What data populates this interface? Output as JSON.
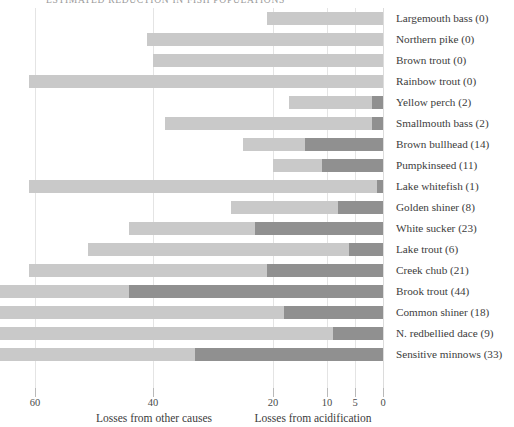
{
  "chart_data": {
    "type": "bar",
    "title": "ESTIMATED REDUCTION IN FISH POPULATIONS",
    "orientation": "horizontal-stacked",
    "stacking": "bidirectional-from-right",
    "grid": true,
    "legend_position": "none",
    "xlabel_left": "Losses from other causes",
    "xlabel_right": "Losses from acidification",
    "ylabel": "",
    "axis_direction": "reversed (values decrease left to right, zero at right)",
    "axis_note": "Broken / expanded scale: 60-20 compressed, 20-0 expanded",
    "tick_values": [
      60,
      40,
      20,
      10,
      5,
      0
    ],
    "tick_labels": [
      "60",
      "40",
      "20",
      "10",
      "5",
      "0"
    ],
    "xlim": [
      66,
      0
    ],
    "categories": [
      "Largemouth bass (0)",
      "Northern pike (0)",
      "Brown trout (0)",
      "Rainbow trout (0)",
      "Yellow perch (2)",
      "Smallmouth bass (2)",
      "Brown bullhead (14)",
      "Pumpkinseed (11)",
      "Lake whitefish (1)",
      "Golden shiner (8)",
      "White sucker (23)",
      "Lake trout (6)",
      "Creek chub (21)",
      "Brook trout (44)",
      "Common shiner (18)",
      "N. redbellied dace (9)",
      "Sensitive minnows (33)"
    ],
    "series": [
      {
        "name": "Losses from other causes",
        "color": "#c9c9c9",
        "values": [
          21,
          41,
          40,
          61,
          15,
          36,
          11,
          9,
          60,
          19,
          21,
          45,
          40,
          24,
          53,
          66,
          41
        ]
      },
      {
        "name": "Losses from acidification",
        "color": "#909090",
        "values": [
          0,
          0,
          0,
          0,
          2,
          2,
          14,
          11,
          1,
          8,
          23,
          6,
          21,
          44,
          18,
          9,
          33
        ]
      }
    ]
  },
  "colors": {
    "other_causes": "#c9c9c9",
    "acidification": "#909090",
    "gridline": "#e4e4e4",
    "text": "#3c3c3c",
    "background": "#ffffff"
  }
}
